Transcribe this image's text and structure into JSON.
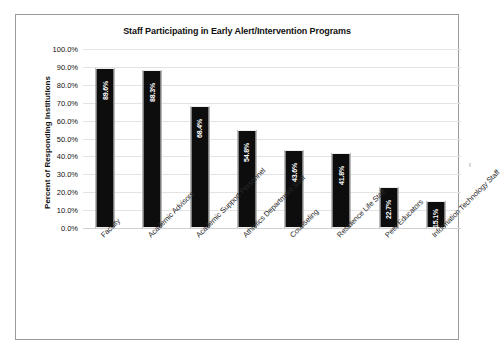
{
  "chart_data": {
    "type": "bar",
    "title": "Staff Participating in Early Alert/Intervention Programs",
    "xlabel": "",
    "ylabel": "Percent of Responding Institutions",
    "ylim": [
      0,
      100
    ],
    "ytick_labels": [
      "100.0%",
      "90.0%",
      "80.0%",
      "70.0%",
      "60.0%",
      "50.0%",
      "40.0%",
      "30.0%",
      "20.0%",
      "10.0%",
      "0.0%"
    ],
    "ytick_values": [
      100,
      90,
      80,
      70,
      60,
      50,
      40,
      30,
      20,
      10,
      0
    ],
    "grid": true,
    "legend": "none",
    "categories": [
      "Faculty",
      "Academic Advisors",
      "Academic Support Personnel",
      "Athletics Department Staff",
      "Counseling",
      "Residence Life Staff",
      "Peer Educators",
      "Information Technology Staff"
    ],
    "values": [
      89.6,
      88.3,
      68.4,
      54.8,
      43.6,
      41.8,
      22.7,
      15.1
    ],
    "data_labels": [
      "89.6%",
      "88.3%",
      "68.4%",
      "54.8%",
      "43.6%",
      "41.8%",
      "22.7%",
      "15.1%"
    ],
    "bar_color": "#0d0d0d",
    "data_label_color": "#ffffff",
    "gridline_color": "#e3e3e3",
    "border_color": "#9a9a9a"
  }
}
